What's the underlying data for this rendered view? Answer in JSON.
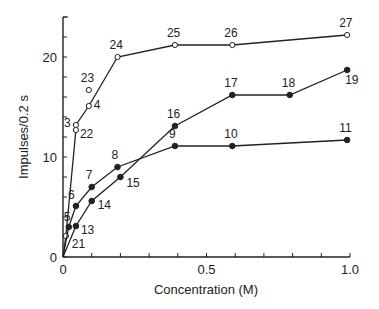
{
  "chart_data": {
    "type": "line",
    "title": "",
    "xlabel": "Concentration (M)",
    "ylabel": "Impulses/0.2 s",
    "xlim": [
      0,
      1.0
    ],
    "ylim": [
      0,
      24
    ],
    "x_ticks": [
      0,
      0.5,
      1.0
    ],
    "x_tick_labels": [
      "0",
      "0.5",
      "1.0"
    ],
    "x_minor_step": 0.1,
    "y_ticks": [
      0,
      10,
      20
    ],
    "y_tick_labels": [
      "0",
      "10",
      "20"
    ],
    "y_minor_step": 2,
    "grid": false,
    "legend": null,
    "series": [
      {
        "name": "upper curve (open circles)",
        "marker": "open",
        "points": [
          {
            "label": "21",
            "x": 0.01,
            "y": 2.1
          },
          {
            "label": "22",
            "x": 0.045,
            "y": 12.7
          },
          {
            "label": "3",
            "x": 0.045,
            "y": 13.2
          },
          {
            "label": "4",
            "x": 0.09,
            "y": 15.1
          },
          {
            "label": "24",
            "x": 0.19,
            "y": 20.0
          },
          {
            "label": "25",
            "x": 0.39,
            "y": 21.2
          },
          {
            "label": "26",
            "x": 0.59,
            "y": 21.2
          },
          {
            "label": "27",
            "x": 0.99,
            "y": 22.2
          }
        ],
        "extra_points": [
          {
            "label": "23",
            "x": 0.09,
            "y": 16.7
          }
        ]
      },
      {
        "name": "middle curve (filled circles, 5-11)",
        "marker": "filled",
        "points": [
          {
            "label": "5",
            "x": 0.02,
            "y": 3.0
          },
          {
            "label": "6",
            "x": 0.045,
            "y": 5.1
          },
          {
            "label": "7",
            "x": 0.1,
            "y": 7.0
          },
          {
            "label": "8",
            "x": 0.19,
            "y": 9.0
          },
          {
            "label": "9",
            "x": 0.39,
            "y": 11.1
          },
          {
            "label": "10",
            "x": 0.59,
            "y": 11.1
          },
          {
            "label": "11",
            "x": 0.99,
            "y": 11.7
          }
        ]
      },
      {
        "name": "lower-rising curve (filled circles, 13-19)",
        "marker": "filled",
        "points": [
          {
            "label": "13",
            "x": 0.045,
            "y": 3.1
          },
          {
            "label": "14",
            "x": 0.1,
            "y": 5.6
          },
          {
            "label": "15",
            "x": 0.2,
            "y": 8.0
          },
          {
            "label": "16",
            "x": 0.39,
            "y": 13.1
          },
          {
            "label": "17",
            "x": 0.59,
            "y": 16.2
          },
          {
            "label": "18",
            "x": 0.79,
            "y": 16.2
          },
          {
            "label": "19",
            "x": 0.99,
            "y": 18.7
          }
        ]
      }
    ],
    "label_offsets": {
      "21": [
        6,
        12
      ],
      "22": [
        4,
        8
      ],
      "3": [
        -12,
        2
      ],
      "4": [
        5,
        3
      ],
      "23": [
        -8,
        -8
      ],
      "24": [
        -8,
        -8
      ],
      "25": [
        -8,
        -8
      ],
      "26": [
        -8,
        -8
      ],
      "27": [
        -8,
        -8
      ],
      "5": [
        -5,
        -6
      ],
      "6": [
        -8,
        -7
      ],
      "7": [
        -6,
        -8
      ],
      "8": [
        -6,
        -8
      ],
      "9": [
        -6,
        -8
      ],
      "10": [
        -8,
        -8
      ],
      "11": [
        -8,
        -8
      ],
      "13": [
        5,
        8
      ],
      "14": [
        6,
        8
      ],
      "15": [
        6,
        10
      ],
      "16": [
        -8,
        -8
      ],
      "17": [
        -8,
        -8
      ],
      "18": [
        -8,
        -8
      ],
      "19": [
        -2,
        14
      ]
    }
  }
}
